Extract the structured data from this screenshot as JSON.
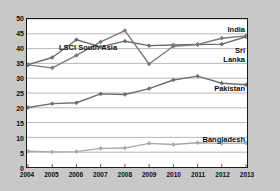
{
  "chart_data": {
    "type": "line",
    "title": "LSCI South Asia",
    "xlabel": "",
    "ylabel": "",
    "grid": true,
    "legend_position": "inline-right",
    "categories": [
      "2004",
      "2005",
      "2006",
      "2007",
      "2008",
      "2009",
      "2010",
      "2011",
      "2012",
      "2013"
    ],
    "x": [
      2004,
      2005,
      2006,
      2007,
      2008,
      2009,
      2010,
      2011,
      2012,
      2013
    ],
    "xlim": [
      2004,
      2013
    ],
    "ylim": [
      0,
      50
    ],
    "yticks": [
      0,
      5,
      10,
      15,
      20,
      25,
      30,
      35,
      40,
      45,
      50
    ],
    "series": [
      {
        "name": "India",
        "color": "#6b6b6b",
        "values": [
          34.6,
          37.0,
          43.0,
          40.6,
          42.5,
          41.0,
          41.2,
          41.4,
          41.5,
          44.0
        ]
      },
      {
        "name": "Sri Lanka",
        "color": "#7a7a7a",
        "values": [
          34.5,
          33.5,
          37.7,
          42.3,
          46.1,
          34.8,
          40.8,
          41.4,
          43.5,
          44.3
        ]
      },
      {
        "name": "Pakistan",
        "color": "#6e6e6e",
        "values": [
          20.1,
          21.4,
          21.7,
          24.7,
          24.5,
          26.5,
          29.4,
          30.7,
          28.3,
          27.8
        ]
      },
      {
        "name": "Bangladesh",
        "color": "#a8a8a8",
        "values": [
          5.3,
          5.1,
          5.2,
          6.3,
          6.4,
          8.0,
          7.6,
          8.2,
          8.0,
          8.1
        ]
      }
    ],
    "annotations": [
      {
        "name": "india-label",
        "text": "India"
      },
      {
        "name": "sri-lanka-label-line1",
        "text": "Sri"
      },
      {
        "name": "sri-lanka-label-line2",
        "text": "Lanka"
      },
      {
        "name": "pakistan-label",
        "text": "Pakistan"
      },
      {
        "name": "bangladesh-label",
        "text": "Bangladesh"
      }
    ],
    "colors": {
      "background": "#c8c8c8",
      "plot_background": "#ffffff",
      "axis": "#1a1a1a",
      "gridline": "#9a9a9a",
      "text": "#0d0d0d"
    }
  }
}
